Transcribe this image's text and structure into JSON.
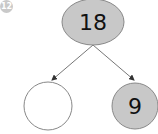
{
  "question_number": "12",
  "number_bond": {
    "whole": "18",
    "parts": [
      "",
      "9"
    ]
  },
  "colors": {
    "filled_node": "#c8c8c8",
    "empty_node": "#ffffff",
    "stroke": "#777777",
    "badge": "#c9c9c9"
  }
}
